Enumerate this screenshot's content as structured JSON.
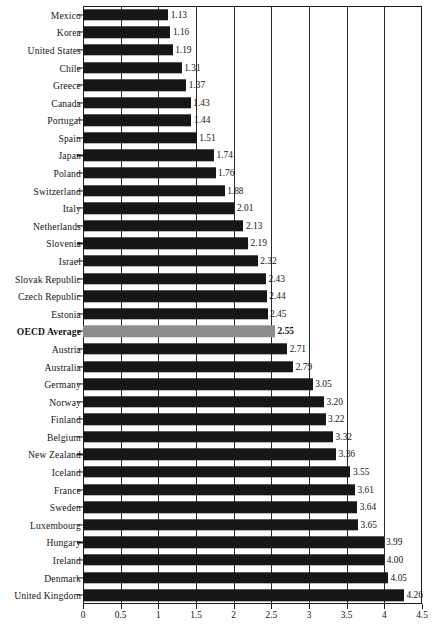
{
  "chart_data": {
    "type": "bar",
    "orientation": "horizontal",
    "title": "",
    "xlabel": "",
    "ylabel": "",
    "xlim": [
      0,
      4.5
    ],
    "xticks": [
      "0",
      "0.5",
      "1",
      "1.5",
      "2",
      "2.5",
      "3",
      "3.5",
      "4",
      "4.5"
    ],
    "xtick_values": [
      0,
      0.5,
      1,
      1.5,
      2,
      2.5,
      3,
      3.5,
      4,
      4.5
    ],
    "grid": true,
    "grid_axis": "x",
    "legend": "none",
    "highlight_category": "OECD Average",
    "highlight_color": "#8d8d8d",
    "bar_color": "#161616",
    "categories": [
      "Mexico",
      "Korea",
      "United States",
      "Chile",
      "Greece",
      "Canada",
      "Portugal",
      "Spain",
      "Japan",
      "Poland",
      "Switzerland",
      "Italy",
      "Netherlands",
      "Slovenia",
      "Israel",
      "Slovak Republic",
      "Czech Republic",
      "Estonia",
      "OECD Average",
      "Austria",
      "Australia",
      "Germany",
      "Norway",
      "Finland",
      "Belgium",
      "New Zealand",
      "Iceland",
      "France",
      "Sweden",
      "Luxembourg",
      "Hungary",
      "Ireland",
      "Denmark",
      "United Kingdom"
    ],
    "values": [
      1.13,
      1.16,
      1.19,
      1.31,
      1.37,
      1.43,
      1.44,
      1.51,
      1.74,
      1.76,
      1.88,
      2.01,
      2.13,
      2.19,
      2.32,
      2.43,
      2.44,
      2.45,
      2.55,
      2.71,
      2.79,
      3.05,
      3.2,
      3.22,
      3.32,
      3.36,
      3.55,
      3.61,
      3.64,
      3.65,
      3.99,
      4.0,
      4.05,
      4.26
    ],
    "value_labels": [
      "1.13",
      "1.16",
      "1.19",
      "1.31",
      "1.37",
      "1.43",
      "1.44",
      "1.51",
      "1.74",
      "1.76",
      "1.88",
      "2.01",
      "2.13",
      "2.19",
      "2.32",
      "2.43",
      "2.44",
      "2.45",
      "2.55",
      "2.71",
      "2.79",
      "3.05",
      "3.20",
      "3.22",
      "3.32",
      "3.36",
      "3.55",
      "3.61",
      "3.64",
      "3.65",
      "3.99",
      "4.00",
      "4.05",
      "4.26"
    ]
  }
}
